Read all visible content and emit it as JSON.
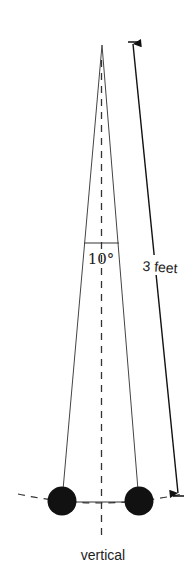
{
  "diagram": {
    "type": "pendulum",
    "angle_label": "10°",
    "length_label": "3 feet",
    "vertical_label": "vertical",
    "colors": {
      "line": "#222222",
      "bob": "#111111",
      "background": "#ffffff"
    }
  }
}
